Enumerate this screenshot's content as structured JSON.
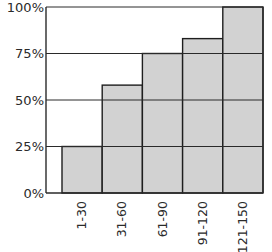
{
  "chart_data": {
    "type": "bar",
    "title": "",
    "xlabel": "",
    "ylabel": "",
    "categories": [
      "1-30",
      "31-60",
      "61-90",
      "91-120",
      "121-150"
    ],
    "values": [
      25,
      58,
      75,
      83,
      100
    ],
    "value_unit": "%",
    "ylim": [
      0,
      100
    ],
    "yticks": [
      0,
      25,
      50,
      75,
      100
    ],
    "ytick_labels": [
      "0%",
      "25%",
      "50%",
      "75%",
      "100%"
    ],
    "grid": true,
    "legend": null,
    "bar_color": "#d2d2d2",
    "bar_edge_color": "#1e1e1e",
    "grid_color": "#2a2a2a",
    "x_tick_rotation": -90
  }
}
